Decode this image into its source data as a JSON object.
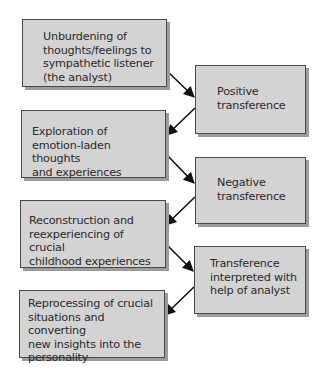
{
  "diagram": {
    "type": "flowchart",
    "layout": "zigzag two-column process",
    "colors": {
      "box_fill": "#d3d3d3",
      "box_border": "#4a4a4a",
      "box_shadow": "#9c9c9c",
      "arrow": "#111111",
      "text": "#2a2a2a",
      "background": "#ffffff"
    },
    "nodes": [
      {
        "id": "n1",
        "column": "left",
        "label": "Unburdening of\nthoughts/feelings to\nsympathetic listener\n(the analyst)"
      },
      {
        "id": "n2",
        "column": "right",
        "label": "Positive\ntransference"
      },
      {
        "id": "n3",
        "column": "left",
        "label": "Exploration of\nemotion-laden thoughts\nand experiences"
      },
      {
        "id": "n4",
        "column": "right",
        "label": "Negative\ntransference"
      },
      {
        "id": "n5",
        "column": "left",
        "label": "Reconstruction and\nreexperiencing of crucial\nchildhood experiences"
      },
      {
        "id": "n6",
        "column": "right",
        "label": "Transference\ninterpreted with\nhelp of analyst"
      },
      {
        "id": "n7",
        "column": "left",
        "label": "Reprocessing of crucial\nsituations and converting\nnew insights into the\npersonality"
      }
    ],
    "edges": [
      {
        "from": "n1",
        "to": "n2"
      },
      {
        "from": "n2",
        "to": "n3"
      },
      {
        "from": "n3",
        "to": "n4"
      },
      {
        "from": "n4",
        "to": "n5"
      },
      {
        "from": "n5",
        "to": "n6"
      },
      {
        "from": "n6",
        "to": "n7"
      }
    ]
  }
}
